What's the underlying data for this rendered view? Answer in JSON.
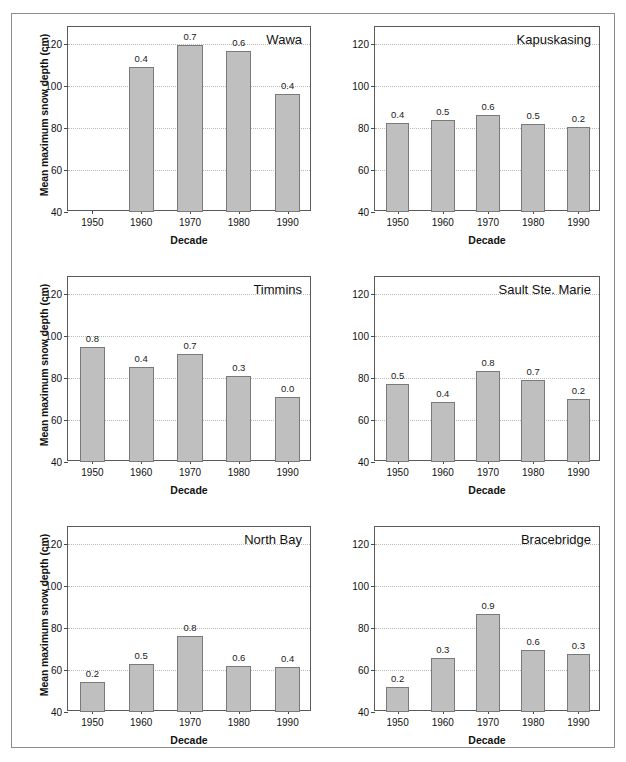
{
  "figure": {
    "shared_xlabel": "Decade",
    "shared_ylabel": "Mean maximum snow depth (cm)",
    "categories": [
      "1950",
      "1960",
      "1970",
      "1980",
      "1990"
    ],
    "yticks": [
      "40",
      "60",
      "80",
      "100",
      "120"
    ],
    "bar_color": "#bfbfbf",
    "bar_edge_color": "#7a7a7a",
    "grid_color": "#b9b9b9",
    "axis_color": "#5a5a5a",
    "frame_color": "#8d8d8d"
  },
  "chart_data": [
    {
      "type": "bar",
      "title": "Wawa",
      "xlabel": "Decade",
      "ylabel": "Mean maximum snow depth (cm)",
      "categories": [
        "1950",
        "1960",
        "1970",
        "1980",
        "1990"
      ],
      "values": [
        null,
        109.0,
        119.5,
        116.5,
        96.0
      ],
      "data_labels": [
        "",
        "0.4",
        "0.7",
        "0.6",
        "0.4"
      ],
      "ylim": [
        40,
        128
      ],
      "yticks": [
        40,
        60,
        80,
        100,
        120
      ],
      "grid": true,
      "legend": "none"
    },
    {
      "type": "bar",
      "title": "Kapuskasing",
      "xlabel": "Decade",
      "ylabel": "Mean maximum snow depth (cm)",
      "categories": [
        "1950",
        "1960",
        "1970",
        "1980",
        "1990"
      ],
      "values": [
        82.5,
        84.0,
        86.0,
        82.0,
        80.5
      ],
      "data_labels": [
        "0.4",
        "0.5",
        "0.6",
        "0.5",
        "0.2"
      ],
      "ylim": [
        40,
        128
      ],
      "yticks": [
        40,
        60,
        80,
        100,
        120
      ],
      "grid": true,
      "legend": "none"
    },
    {
      "type": "bar",
      "title": "Timmins",
      "xlabel": "Decade",
      "ylabel": "Mean maximum snow depth (cm)",
      "categories": [
        "1950",
        "1960",
        "1970",
        "1980",
        "1990"
      ],
      "values": [
        94.5,
        85.0,
        91.5,
        81.0,
        71.0
      ],
      "data_labels": [
        "0.8",
        "0.4",
        "0.7",
        "0.3",
        "0.0"
      ],
      "ylim": [
        40,
        128
      ],
      "yticks": [
        40,
        60,
        80,
        100,
        120
      ],
      "grid": true,
      "legend": "none"
    },
    {
      "type": "bar",
      "title": "Sault Ste. Marie",
      "xlabel": "Decade",
      "ylabel": "Mean maximum snow depth (cm)",
      "categories": [
        "1950",
        "1960",
        "1970",
        "1980",
        "1990"
      ],
      "values": [
        77.0,
        68.5,
        83.5,
        79.0,
        70.0
      ],
      "data_labels": [
        "0.5",
        "0.4",
        "0.8",
        "0.7",
        "0.2"
      ],
      "ylim": [
        40,
        128
      ],
      "yticks": [
        40,
        60,
        80,
        100,
        120
      ],
      "grid": true,
      "legend": "none"
    },
    {
      "type": "bar",
      "title": "North Bay",
      "xlabel": "Decade",
      "ylabel": "Mean maximum snow depth (cm)",
      "categories": [
        "1950",
        "1960",
        "1970",
        "1980",
        "1990"
      ],
      "values": [
        54.5,
        63.0,
        76.0,
        62.0,
        61.5
      ],
      "data_labels": [
        "0.2",
        "0.5",
        "0.8",
        "0.6",
        "0.4"
      ],
      "ylim": [
        40,
        128
      ],
      "yticks": [
        40,
        60,
        80,
        100,
        120
      ],
      "grid": true,
      "legend": "none"
    },
    {
      "type": "bar",
      "title": "Bracebridge",
      "xlabel": "Decade",
      "ylabel": "Mean maximum snow depth (cm)",
      "categories": [
        "1950",
        "1960",
        "1970",
        "1980",
        "1990"
      ],
      "values": [
        52.0,
        65.5,
        86.5,
        69.5,
        67.5
      ],
      "data_labels": [
        "0.2",
        "0.3",
        "0.9",
        "0.6",
        "0.3"
      ],
      "ylim": [
        40,
        128
      ],
      "yticks": [
        40,
        60,
        80,
        100,
        120
      ],
      "grid": true,
      "legend": "none"
    }
  ]
}
